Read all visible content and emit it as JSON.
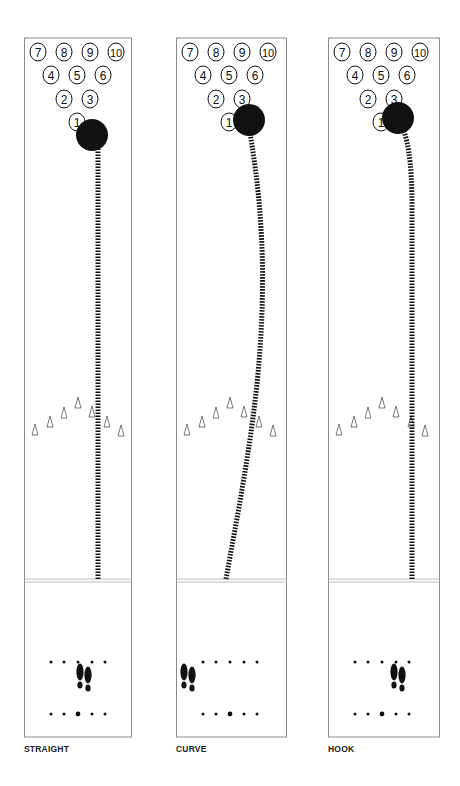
{
  "figure": {
    "lanes": [
      {
        "id": "straight",
        "label": "STRAIGHT",
        "ball_path": "straight",
        "ball_target": "1-pin pocket (right side of head pin)",
        "stance": "center",
        "pins": [
          "7",
          "8",
          "9",
          "10",
          "4",
          "5",
          "6",
          "2",
          "3",
          "1"
        ]
      },
      {
        "id": "curve",
        "label": "CURVE",
        "ball_path": "wide arc from left foul line out to right then back into pocket",
        "ball_target": "1-3 pocket",
        "stance": "far left",
        "pins": [
          "7",
          "8",
          "9",
          "10",
          "4",
          "5",
          "6",
          "2",
          "3",
          "1"
        ]
      },
      {
        "id": "hook",
        "label": "HOOK",
        "ball_path": "straight down right side then hooks left into pocket",
        "ball_target": "1-3 pocket",
        "stance": "right of center",
        "pins": [
          "7",
          "8",
          "9",
          "10",
          "4",
          "5",
          "6",
          "2",
          "3",
          "1"
        ]
      }
    ],
    "colors": {
      "ink": "#111111",
      "lane_border": "#8a8a8a",
      "foul_line": "#bdbdbd",
      "background": "#ffffff"
    }
  }
}
